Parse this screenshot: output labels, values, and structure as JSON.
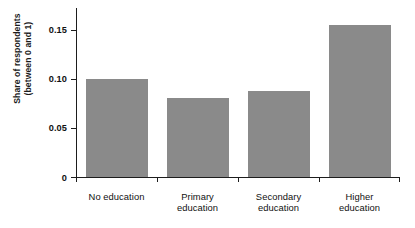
{
  "chart_data": {
    "type": "bar",
    "title": "",
    "xlabel": "",
    "ylabel": "Share of respondents (between 0 and 1)",
    "ylabel_line1": "Share of respondents",
    "ylabel_line2": "(between 0 and 1)",
    "categories": [
      "No education",
      "Primary education",
      "Secondary education",
      "Higher education"
    ],
    "category_lines": [
      [
        "No education"
      ],
      [
        "Primary",
        "education"
      ],
      [
        "Secondary",
        "education"
      ],
      [
        "Higher",
        "education"
      ]
    ],
    "values": [
      0.1,
      0.08,
      0.0875,
      0.155
    ],
    "ylim": [
      0,
      0.172
    ],
    "yticks": [
      0,
      0.05,
      0.1,
      0.15
    ],
    "ytick_labels": [
      "0",
      "0.05",
      "0.10",
      "0.15"
    ],
    "grid": false,
    "legend": null,
    "bar_color": "#8a8a8a",
    "axis_color": "#1d1d1d",
    "text_color": "#111111"
  },
  "cropped_title": ""
}
